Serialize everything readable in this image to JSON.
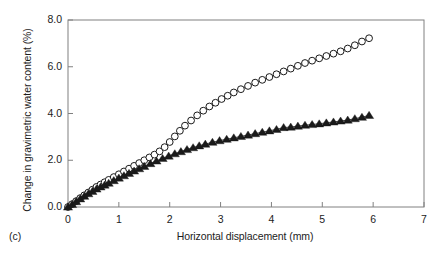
{
  "figure": {
    "panel_caption": "(c)",
    "background_color": "#ffffff",
    "axis_color": "#808080",
    "marker_color": "#1a1a1a"
  },
  "chart_data": {
    "type": "scatter",
    "title": "",
    "subtitle": "",
    "xlabel": "Horizontal displacement (mm)",
    "ylabel": "Change in gravimetric water content (%)",
    "xlim": [
      0,
      7
    ],
    "ylim": [
      0.0,
      8.0
    ],
    "xticks": [
      0,
      1,
      2,
      3,
      4,
      5,
      6,
      7
    ],
    "xtick_labels": [
      "0",
      "1",
      "2",
      "3",
      "4",
      "5",
      "6",
      "7"
    ],
    "yticks": [
      0.0,
      2.0,
      4.0,
      6.0,
      8.0
    ],
    "ytick_labels": [
      "0.0",
      "2.0",
      "4.0",
      "6.0",
      "8.0"
    ],
    "grid": false,
    "legend": null,
    "annotations": [],
    "series": [
      {
        "name": "open-circle-series",
        "marker": "open-circle",
        "marker_size": 3.4,
        "line": true,
        "x": [
          0.0,
          0.08,
          0.16,
          0.24,
          0.32,
          0.4,
          0.48,
          0.56,
          0.64,
          0.72,
          0.8,
          0.9,
          1.0,
          1.1,
          1.2,
          1.3,
          1.4,
          1.5,
          1.6,
          1.7,
          1.8,
          1.9,
          2.0,
          2.1,
          2.2,
          2.3,
          2.42,
          2.54,
          2.66,
          2.78,
          2.9,
          3.02,
          3.14,
          3.26,
          3.4,
          3.54,
          3.68,
          3.82,
          3.96,
          4.1,
          4.24,
          4.38,
          4.52,
          4.66,
          4.8,
          4.94,
          5.08,
          5.22,
          5.36,
          5.5,
          5.64,
          5.78,
          5.92
        ],
        "y": [
          0.0,
          0.12,
          0.25,
          0.38,
          0.5,
          0.62,
          0.74,
          0.86,
          0.96,
          1.06,
          1.16,
          1.28,
          1.4,
          1.52,
          1.64,
          1.76,
          1.88,
          2.0,
          2.12,
          2.24,
          2.38,
          2.56,
          2.78,
          3.02,
          3.26,
          3.48,
          3.7,
          3.92,
          4.12,
          4.3,
          4.46,
          4.62,
          4.76,
          4.9,
          5.04,
          5.18,
          5.32,
          5.44,
          5.56,
          5.68,
          5.8,
          5.92,
          6.04,
          6.16,
          6.26,
          6.36,
          6.46,
          6.56,
          6.66,
          6.78,
          6.92,
          7.08,
          7.22
        ]
      },
      {
        "name": "filled-triangle-series",
        "marker": "filled-triangle",
        "marker_size": 4.0,
        "line": true,
        "x": [
          0.0,
          0.08,
          0.16,
          0.24,
          0.32,
          0.4,
          0.48,
          0.56,
          0.64,
          0.72,
          0.8,
          0.9,
          1.0,
          1.1,
          1.2,
          1.3,
          1.4,
          1.5,
          1.62,
          1.74,
          1.86,
          1.98,
          2.1,
          2.22,
          2.34,
          2.46,
          2.58,
          2.7,
          2.84,
          2.98,
          3.12,
          3.26,
          3.4,
          3.54,
          3.68,
          3.82,
          3.96,
          4.1,
          4.24,
          4.38,
          4.52,
          4.66,
          4.8,
          4.94,
          5.08,
          5.22,
          5.36,
          5.5,
          5.64,
          5.78,
          5.92
        ],
        "y": [
          0.0,
          0.11,
          0.23,
          0.35,
          0.46,
          0.57,
          0.67,
          0.77,
          0.86,
          0.94,
          1.02,
          1.13,
          1.24,
          1.34,
          1.44,
          1.54,
          1.64,
          1.74,
          1.86,
          1.97,
          2.08,
          2.18,
          2.28,
          2.37,
          2.46,
          2.54,
          2.62,
          2.69,
          2.77,
          2.84,
          2.9,
          2.96,
          3.02,
          3.08,
          3.14,
          3.2,
          3.26,
          3.32,
          3.4,
          3.42,
          3.46,
          3.5,
          3.53,
          3.56,
          3.6,
          3.64,
          3.68,
          3.72,
          3.78,
          3.84,
          3.92
        ]
      }
    ]
  }
}
